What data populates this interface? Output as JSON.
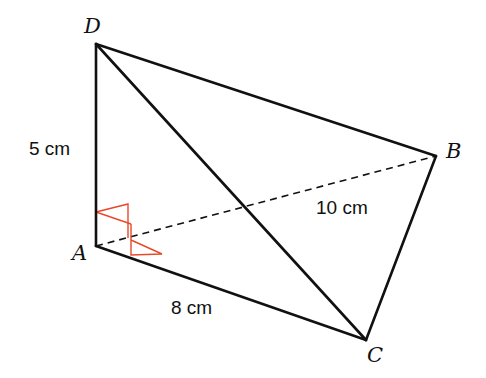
{
  "figure": {
    "type": "3D tetrahedron diagram",
    "vertices": {
      "A": {
        "label": "A",
        "x": 96,
        "y": 246
      },
      "B": {
        "label": "B",
        "x": 436,
        "y": 156
      },
      "C": {
        "label": "C",
        "x": 366,
        "y": 340
      },
      "D": {
        "label": "D",
        "x": 96,
        "y": 44
      }
    },
    "edges": {
      "AD": {
        "style": "solid",
        "length_label": "5 cm"
      },
      "AC": {
        "style": "solid",
        "length_label": "8 cm"
      },
      "AB": {
        "style": "dashed",
        "length_label": "10 cm"
      },
      "DB": {
        "style": "solid"
      },
      "DC": {
        "style": "solid"
      },
      "BC": {
        "style": "solid"
      }
    },
    "right_angle_marks": [
      "DAB",
      "DAC"
    ],
    "colors": {
      "line": "#111111",
      "right_angle_mark": "#e8492a"
    }
  }
}
